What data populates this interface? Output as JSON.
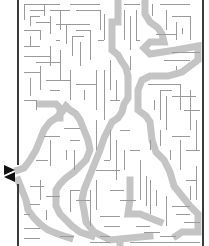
{
  "puzzle": {
    "type": "maze",
    "cell_size": 5.5,
    "bounds": {
      "left": 18,
      "right": 203,
      "top": 0,
      "bottom": 246
    },
    "colors": {
      "background": "#ffffff",
      "wall": "#9a9a9a",
      "border": "#3a3a3a",
      "solution": "#c4c4c4",
      "arrow": "#111111"
    },
    "entrance_arrows": [
      {
        "points": "4,165 15,170 4,175",
        "name": "entry-arrow-icon"
      },
      {
        "points": "15,172 4,177 15,182",
        "name": "exit-arrow-icon"
      }
    ],
    "solution_paths": [
      {
        "width": 7,
        "points": "118,0 118,22 112,22 112,50 118,55 122,62 126,68 128,76 128,98 124,104 122,112 118,118 112,122 108,130 104,138 100,150 96,160 92,170 88,180 84,190 82,200 84,210 86,222 94,232 110,240 130,238 150,236"
      },
      {
        "width": 7,
        "points": "145,0 145,14 150,22 158,28 162,34 164,42 150,42 144,48 150,54 176,50 198,46 198,60 190,66 182,72 168,76 150,76 142,80 138,90 138,110 146,116 150,122 152,140 156,152 164,160 170,172 174,186 182,196 190,206 198,214 198,232 182,232 176,236"
      },
      {
        "width": 7,
        "points": "18,170 24,168 30,160 36,150 40,140 44,130 50,122 56,118 62,112 66,106 70,110 76,114 80,120 84,130 88,140 90,150 86,160 80,166 74,172 66,178 60,184 56,190 56,206 60,214 66,220 72,226 80,232 92,236"
      },
      {
        "width": 7,
        "points": "18,180 22,190 26,200 28,210 34,218 40,224 48,230 58,234 70,238"
      },
      {
        "width": 7,
        "points": "40,104 56,104 60,108 60,118"
      },
      {
        "width": 7,
        "points": "130,180 130,200 128,214 140,214 150,218 160,222"
      },
      {
        "width": 7,
        "points": "120,240 120,246"
      }
    ],
    "walls": [
      [
        24,
        4,
        60,
        4
      ],
      [
        24,
        4,
        24,
        20
      ],
      [
        30,
        10,
        44,
        10
      ],
      [
        44,
        4,
        44,
        16
      ],
      [
        50,
        10,
        70,
        10
      ],
      [
        60,
        10,
        60,
        30
      ],
      [
        70,
        4,
        100,
        4
      ],
      [
        76,
        10,
        100,
        10
      ],
      [
        100,
        10,
        100,
        30
      ],
      [
        30,
        16,
        40,
        16
      ],
      [
        30,
        16,
        30,
        26
      ],
      [
        36,
        22,
        50,
        22
      ],
      [
        50,
        16,
        50,
        34
      ],
      [
        24,
        30,
        40,
        30
      ],
      [
        40,
        30,
        40,
        40
      ],
      [
        30,
        36,
        30,
        46
      ],
      [
        24,
        46,
        40,
        46
      ],
      [
        56,
        24,
        90,
        24
      ],
      [
        66,
        24,
        66,
        44
      ],
      [
        76,
        30,
        90,
        30
      ],
      [
        90,
        30,
        90,
        60
      ],
      [
        72,
        36,
        84,
        36
      ],
      [
        72,
        36,
        72,
        56
      ],
      [
        80,
        42,
        80,
        66
      ],
      [
        56,
        40,
        60,
        40
      ],
      [
        24,
        56,
        50,
        56
      ],
      [
        50,
        46,
        50,
        66
      ],
      [
        36,
        62,
        60,
        62
      ],
      [
        60,
        50,
        60,
        80
      ],
      [
        24,
        72,
        40,
        72
      ],
      [
        40,
        66,
        40,
        90
      ],
      [
        30,
        78,
        30,
        96
      ],
      [
        46,
        80,
        70,
        80
      ],
      [
        70,
        70,
        70,
        100
      ],
      [
        76,
        84,
        96,
        84
      ],
      [
        96,
        70,
        96,
        110
      ],
      [
        50,
        90,
        60,
        90
      ],
      [
        24,
        100,
        36,
        100
      ],
      [
        36,
        100,
        36,
        110
      ],
      [
        84,
        90,
        84,
        100
      ],
      [
        104,
        14,
        104,
        40
      ],
      [
        104,
        40,
        98,
        40
      ],
      [
        110,
        60,
        110,
        90
      ],
      [
        104,
        70,
        104,
        120
      ],
      [
        116,
        80,
        116,
        100
      ],
      [
        110,
        100,
        120,
        100
      ],
      [
        124,
        4,
        140,
        4
      ],
      [
        124,
        10,
        124,
        40
      ],
      [
        130,
        16,
        130,
        50
      ],
      [
        136,
        10,
        136,
        40
      ],
      [
        136,
        40,
        140,
        40
      ],
      [
        130,
        56,
        130,
        70
      ],
      [
        152,
        4,
        152,
        16
      ],
      [
        160,
        4,
        190,
        4
      ],
      [
        166,
        10,
        166,
        30
      ],
      [
        172,
        16,
        190,
        16
      ],
      [
        190,
        16,
        190,
        40
      ],
      [
        176,
        22,
        176,
        40
      ],
      [
        156,
        34,
        176,
        34
      ],
      [
        182,
        28,
        182,
        34
      ],
      [
        172,
        52,
        200,
        52
      ],
      [
        164,
        60,
        190,
        60
      ],
      [
        176,
        66,
        176,
        70
      ],
      [
        148,
        84,
        180,
        84
      ],
      [
        180,
        84,
        180,
        110
      ],
      [
        160,
        90,
        172,
        90
      ],
      [
        160,
        90,
        160,
        120
      ],
      [
        166,
        96,
        166,
        130
      ],
      [
        172,
        96,
        196,
        96
      ],
      [
        190,
        90,
        190,
        130
      ],
      [
        154,
        100,
        154,
        110
      ],
      [
        184,
        110,
        200,
        110
      ],
      [
        196,
        120,
        196,
        150
      ],
      [
        172,
        136,
        190,
        136
      ],
      [
        180,
        140,
        180,
        170
      ],
      [
        186,
        150,
        200,
        150
      ],
      [
        170,
        150,
        170,
        160
      ],
      [
        160,
        130,
        160,
        146
      ],
      [
        44,
        136,
        60,
        136
      ],
      [
        50,
        140,
        50,
        166
      ],
      [
        36,
        160,
        48,
        160
      ],
      [
        64,
        128,
        80,
        128
      ],
      [
        70,
        140,
        80,
        140
      ],
      [
        74,
        150,
        74,
        170
      ],
      [
        66,
        150,
        66,
        160
      ],
      [
        96,
        120,
        96,
        150
      ],
      [
        110,
        130,
        110,
        160
      ],
      [
        116,
        140,
        116,
        180
      ],
      [
        120,
        130,
        130,
        130
      ],
      [
        104,
        160,
        110,
        160
      ],
      [
        96,
        170,
        120,
        170
      ],
      [
        30,
        186,
        44,
        186
      ],
      [
        40,
        180,
        40,
        200
      ],
      [
        46,
        196,
        60,
        196
      ],
      [
        30,
        204,
        40,
        204
      ],
      [
        24,
        214,
        30,
        214
      ],
      [
        24,
        228,
        40,
        228
      ],
      [
        46,
        210,
        46,
        220
      ],
      [
        70,
        190,
        80,
        190
      ],
      [
        70,
        190,
        70,
        212
      ],
      [
        76,
        200,
        90,
        200
      ],
      [
        90,
        190,
        90,
        226
      ],
      [
        96,
        180,
        96,
        210
      ],
      [
        100,
        216,
        120,
        216
      ],
      [
        104,
        226,
        120,
        226
      ],
      [
        110,
        190,
        124,
        190
      ],
      [
        140,
        160,
        140,
        200
      ],
      [
        146,
        176,
        146,
        206
      ],
      [
        120,
        200,
        136,
        200
      ],
      [
        136,
        226,
        150,
        226
      ],
      [
        144,
        232,
        160,
        232
      ],
      [
        150,
        180,
        150,
        214
      ],
      [
        156,
        190,
        156,
        206
      ],
      [
        166,
        196,
        166,
        226
      ],
      [
        172,
        206,
        190,
        206
      ],
      [
        176,
        214,
        190,
        214
      ],
      [
        184,
        222,
        200,
        222
      ],
      [
        196,
        166,
        196,
        200
      ],
      [
        186,
        180,
        196,
        180
      ],
      [
        190,
        186,
        190,
        200
      ],
      [
        60,
        236,
        74,
        236
      ],
      [
        100,
        236,
        110,
        236
      ],
      [
        160,
        236,
        176,
        236
      ],
      [
        24,
        238,
        40,
        238
      ],
      [
        90,
        242,
        110,
        242
      ],
      [
        130,
        242,
        200,
        242
      ],
      [
        150,
        140,
        150,
        150
      ],
      [
        124,
        150,
        124,
        170
      ],
      [
        130,
        150,
        140,
        150
      ]
    ]
  }
}
